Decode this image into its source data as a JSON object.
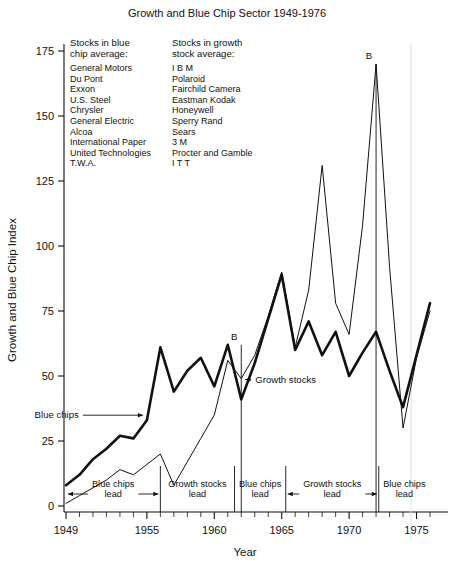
{
  "chart_data": {
    "type": "line",
    "title": "Growth and Blue Chip Sector 1949-1976",
    "xlabel": "Year",
    "ylabel": "Growth and Blue Chip Index",
    "xlim": [
      1949,
      1976
    ],
    "ylim": [
      0,
      180
    ],
    "yticks": [
      0,
      25,
      50,
      75,
      100,
      125,
      150,
      175
    ],
    "xticks": [
      1949,
      1955,
      1960,
      1965,
      1970,
      1975
    ],
    "xticks_minor": [
      1950,
      1951,
      1952,
      1953,
      1954,
      1956,
      1957,
      1958,
      1959,
      1961,
      1962,
      1963,
      1964,
      1966,
      1967,
      1968,
      1969,
      1971,
      1972,
      1973,
      1974,
      1976
    ],
    "grid": false,
    "legend_position": "inline-annotation",
    "x": [
      1949,
      1950,
      1951,
      1952,
      1953,
      1954,
      1955,
      1956,
      1957,
      1958,
      1959,
      1960,
      1961,
      1962,
      1963,
      1964,
      1965,
      1966,
      1967,
      1968,
      1969,
      1970,
      1971,
      1972,
      1973,
      1974,
      1975,
      1976
    ],
    "series": [
      {
        "name": "Blue chips",
        "style": "thick",
        "values": [
          8,
          12,
          18,
          22,
          27,
          26,
          33,
          61,
          44,
          52,
          57,
          46,
          62,
          41,
          55,
          72,
          89,
          60,
          71,
          58,
          67,
          50,
          59,
          67,
          52,
          38,
          58,
          78
        ]
      },
      {
        "name": "Growth stocks",
        "style": "thin",
        "values": [
          1,
          4,
          7,
          10,
          14,
          12,
          16,
          20,
          8,
          17,
          26,
          35,
          56,
          49,
          58,
          73,
          90,
          61,
          83,
          131,
          78,
          66,
          108,
          170,
          92,
          30,
          57,
          75
        ]
      }
    ],
    "annotations": [
      {
        "label": "Blue chips",
        "kind": "series-callout",
        "target_series": "Blue chips",
        "target_year": 1955
      },
      {
        "label": "Growth stocks",
        "kind": "series-callout",
        "target_series": "Growth stocks",
        "target_year": 1962
      },
      {
        "label": "B",
        "kind": "point-marker",
        "year": 1962,
        "value": 62
      },
      {
        "label": "B",
        "kind": "point-marker",
        "year": 1972,
        "value": 170
      }
    ],
    "period_bands": [
      {
        "label": "Blue chips lead",
        "start": 1949,
        "end": 1956
      },
      {
        "label": "Growth stocks lead",
        "start": 1956,
        "end": 1961.5
      },
      {
        "label": "Blue chips lead",
        "start": 1961.5,
        "end": 1965.3
      },
      {
        "label": "Growth stocks lead",
        "start": 1965.3,
        "end": 1972.2
      },
      {
        "label": "Blue chips lead",
        "start": 1972.2,
        "end": 1976
      }
    ]
  },
  "legend": {
    "blue_chip": {
      "header_line1": "Stocks in blue",
      "header_line2": "chip average:",
      "items": [
        "General Motors",
        "Du Pont",
        "Exxon",
        "U.S. Steel",
        "Chrysler",
        "General Electric",
        "Alcoa",
        "International Paper",
        "United Technologies",
        "T.W.A."
      ]
    },
    "growth": {
      "header_line1": "Stocks in growth",
      "header_line2": "stock average:",
      "items": [
        "I B M",
        "Polaroid",
        "Fairchild Camera",
        "Eastman Kodak",
        "Honeywell",
        "Sperry Rand",
        "Sears",
        "3 M",
        "Procter and Gamble",
        "I T T"
      ]
    }
  },
  "colors": {
    "ink": "#111111",
    "background": "#ffffff",
    "faint_rule": "#d8d8d8"
  }
}
